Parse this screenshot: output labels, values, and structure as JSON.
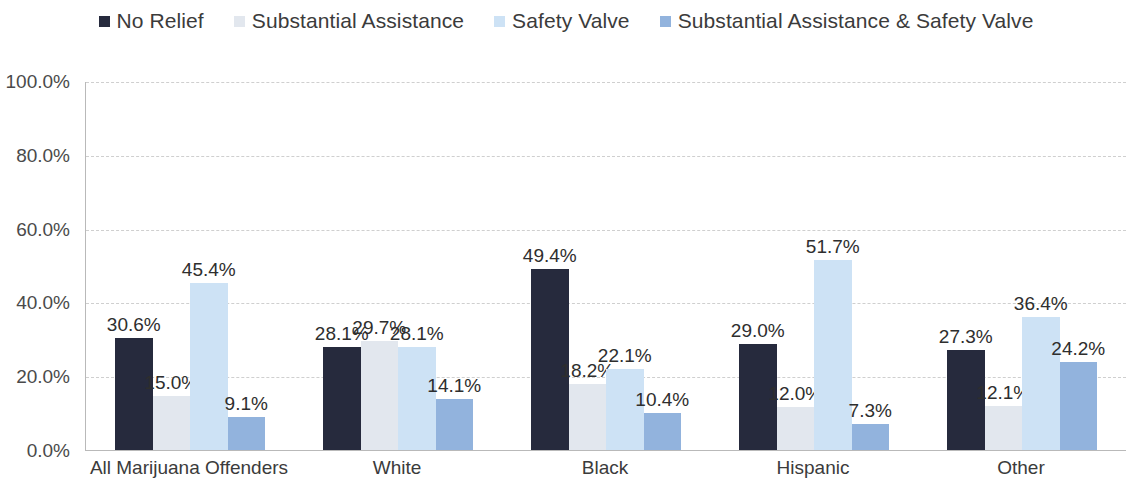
{
  "chart_data": {
    "type": "bar",
    "title": "",
    "xlabel": "",
    "ylabel": "",
    "ylim": [
      0,
      100
    ],
    "ytick_labels": [
      "100.0%",
      "80.0%",
      "60.0%",
      "40.0%",
      "20.0%",
      "0.0%"
    ],
    "ytick_values": [
      100,
      80,
      60,
      40,
      20,
      0
    ],
    "grid": true,
    "legend_position": "top",
    "categories": [
      "All Marijuana Offenders",
      "White",
      "Black",
      "Hispanic",
      "Other"
    ],
    "series": [
      {
        "name": "No Relief",
        "color": "#262a3d",
        "values": [
          30.6,
          28.1,
          49.4,
          29.0,
          27.3
        ],
        "labels": [
          "30.6%",
          "28.1%",
          "49.4%",
          "29.0%",
          "27.3%"
        ]
      },
      {
        "name": "Substantial Assistance",
        "color": "#e2e7ee",
        "values": [
          15.0,
          29.7,
          18.2,
          12.0,
          12.1
        ],
        "labels": [
          "15.0%",
          "29.7%",
          "18.2%",
          "12.0%",
          "12.1%"
        ]
      },
      {
        "name": "Safety Valve",
        "color": "#cde2f5",
        "values": [
          45.4,
          28.1,
          22.1,
          51.7,
          36.4
        ],
        "labels": [
          "45.4%",
          "28.1%",
          "22.1%",
          "51.7%",
          "36.4%"
        ]
      },
      {
        "name": "Substantial Assistance & Safety Valve",
        "color": "#92b3dd",
        "values": [
          9.1,
          14.1,
          10.4,
          7.3,
          24.2
        ],
        "labels": [
          "9.1%",
          "14.1%",
          "10.4%",
          "7.3%",
          "24.2%"
        ]
      }
    ]
  }
}
